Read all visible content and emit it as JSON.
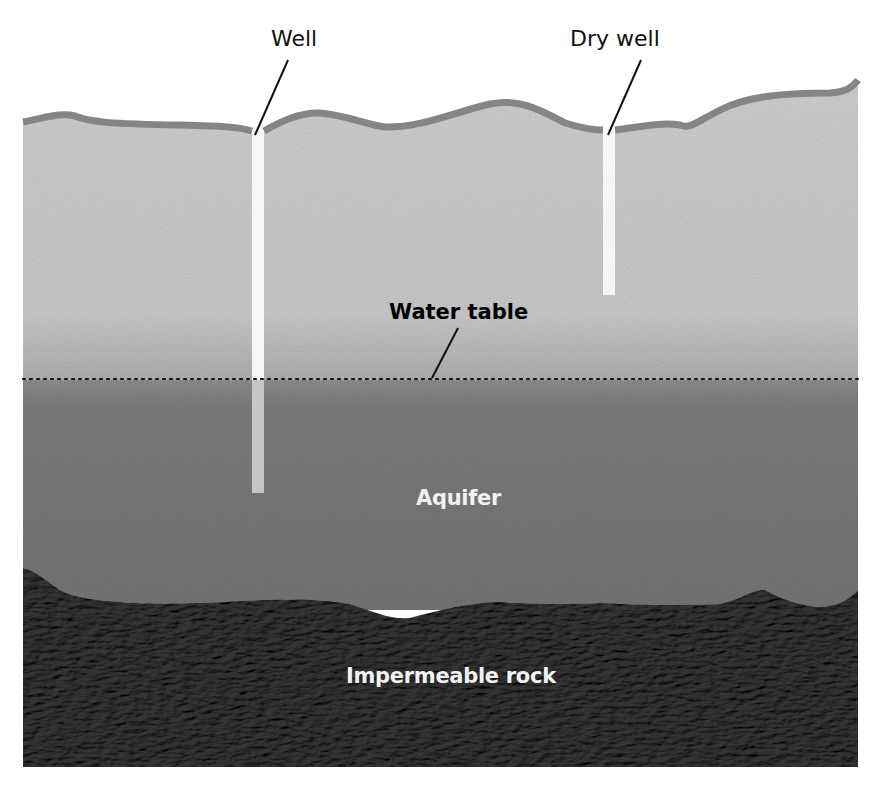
{
  "diagram": {
    "labels": {
      "well": "Well",
      "dry_well": "Dry well",
      "water_table": "Water table",
      "aquifer": "Aquifer",
      "impermeable_rock": "Impermeable rock"
    },
    "layers": [
      {
        "name": "Unsaturated soil",
        "color": "#c8c8c8"
      },
      {
        "name": "Aquifer",
        "color": "#7a7a7a"
      },
      {
        "name": "Impermeable rock",
        "color": "#5e5e5e"
      }
    ],
    "colors": {
      "background": "#ffffff",
      "topsoil_edge": "#8a8a8a",
      "soil": "#c9c9c9",
      "aquifer": "#787878",
      "rock": "#5f5f5f",
      "well_shaft": "#f4f4f4",
      "well_shaft_submerged": "#c4c4c4",
      "text_dark": "#111111",
      "text_light": "#f2f2f2"
    }
  }
}
